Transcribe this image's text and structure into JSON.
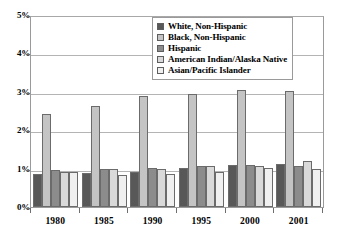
{
  "chart_data": {
    "type": "bar",
    "title": "",
    "xlabel": "",
    "ylabel": "",
    "ylim": [
      0,
      5
    ],
    "ytick_labels": [
      "5%",
      "4%",
      "3%",
      "2%",
      "1%",
      "0%"
    ],
    "ytick_values": [
      5,
      4,
      3,
      2,
      1,
      0
    ],
    "grid": true,
    "legend_position": "top-right",
    "categories": [
      "1980",
      "1985",
      "1990",
      "1995",
      "2000",
      "2001"
    ],
    "series": [
      {
        "name": "White, Non-Hispanic",
        "color": "#585858",
        "values": [
          0.87,
          0.89,
          0.93,
          1.02,
          1.11,
          1.13
        ]
      },
      {
        "name": "Black, Non-Hispanic",
        "color": "#c4c4c4",
        "values": [
          2.45,
          2.67,
          2.93,
          2.98,
          3.07,
          3.05
        ]
      },
      {
        "name": "Hispanic",
        "color": "#8c8c8c",
        "values": [
          0.98,
          1.0,
          1.02,
          1.09,
          1.1,
          1.09
        ]
      },
      {
        "name": "American Indian/Alaska Native",
        "color": "#d9d9d9",
        "values": [
          0.93,
          1.0,
          1.0,
          1.08,
          1.09,
          1.2
        ]
      },
      {
        "name": "Asian/Pacific Islander",
        "color": "#f0f0f0",
        "values": [
          0.92,
          0.85,
          0.86,
          0.91,
          1.02,
          1.0
        ]
      }
    ]
  },
  "legend": {
    "items": [
      {
        "label": "White, Non-Hispanic"
      },
      {
        "label": "Black, Non-Hispanic"
      },
      {
        "label": "Hispanic"
      },
      {
        "label": "American Indian/Alaska Native"
      },
      {
        "label": "Asian/Pacific Islander"
      }
    ]
  }
}
